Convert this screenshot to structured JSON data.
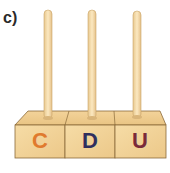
{
  "label": "c)",
  "abacus": {
    "rods": 3,
    "columns": [
      {
        "letter": "C",
        "color": "#e07a2e"
      },
      {
        "letter": "D",
        "color": "#2f2f5e"
      },
      {
        "letter": "U",
        "color": "#7a2a3a"
      }
    ],
    "wood_color": "#f2d49a",
    "rod_color": "#f7dfae"
  }
}
